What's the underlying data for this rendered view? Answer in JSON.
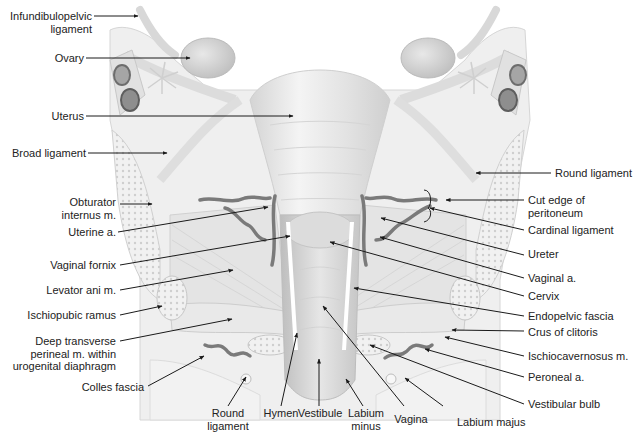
{
  "figure": {
    "colors": {
      "tissue_light": "#ececec",
      "tissue_mid": "#d8d8d8",
      "tissue_dark": "#bdbdbd",
      "vessel": "#7a7a7a",
      "ovary_vessel_dark": "#5e5e5e",
      "leader_line": "#1a1a1a",
      "text": "#222222"
    }
  },
  "labels": {
    "infundibulopelvic": "Infundibulopelvic",
    "infundibulopelvic_2": "ligament",
    "ovary": "Ovary",
    "uterus": "Uterus",
    "broad_ligament": "Broad ligament",
    "obturator": "Obturator",
    "obturator_2": "internus m.",
    "uterine_a": "Uterine a.",
    "vaginal_fornix": "Vaginal fornix",
    "levator_ani": "Levator ani m.",
    "ischiopubic_ramus": "Ischiopubic ramus",
    "deep_transverse": "Deep transverse",
    "deep_transverse_2": "perineal m. within",
    "deep_transverse_3": "urogenital diaphragm",
    "colles_fascia": "Colles fascia",
    "round_ligament_bottom": "Round",
    "round_ligament_bottom_2": "ligament",
    "hymen": "Hymen",
    "vestibule": "Vestibule",
    "labium_minus": "Labium",
    "labium_minus_2": "minus",
    "vagina": "Vagina",
    "labium_majus": "Labium majus",
    "round_ligament_right": "Round ligament",
    "cut_edge": "Cut edge of",
    "cut_edge_2": "peritoneum",
    "cardinal_ligament": "Cardinal ligament",
    "ureter": "Ureter",
    "vaginal_a": "Vaginal a.",
    "cervix": "Cervix",
    "endopelvic_fascia": "Endopelvic fascia",
    "crus_of_clitoris": "Crus of clitoris",
    "ischiocavernosus": "Ischiocavernosus m.",
    "peroneal_a": "Peroneal a.",
    "vestibular_bulb": "Vestibular bulb"
  }
}
